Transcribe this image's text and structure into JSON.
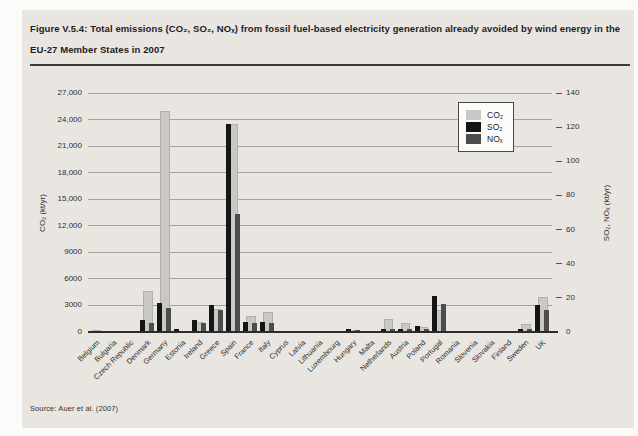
{
  "figure": {
    "title_line1": "Figure V.5.4: Total emissions (CO₂, SO₂, NOₓ) from fossil fuel-based electricity generation already avoided by wind energy in the",
    "title_line2": "EU-27 Member States in 2007",
    "source": "Source: Auer et al. (2007)"
  },
  "colors": {
    "panel_bg": "#e9e6e2",
    "co2": "#c9c8c4",
    "so2": "#151515",
    "nox": "#4c4c4c",
    "grid": "#a3a29f",
    "baseline": "#2c2c2c",
    "text": "#2e2e2e"
  },
  "chart_data": {
    "type": "bar",
    "title": "",
    "categories": [
      "Belgium",
      "Bulgaria",
      "Czech Republic",
      "Denmark",
      "Germany",
      "Estonia",
      "Ireland",
      "Greece",
      "Spain",
      "France",
      "Italy",
      "Cyprus",
      "Latvia",
      "Lithuania",
      "Luxembourg",
      "Hungary",
      "Malta",
      "Netherlands",
      "Austria",
      "Poland",
      "Portugal",
      "Romania",
      "Slovenia",
      "Slovakia",
      "Finland",
      "Sweden",
      "UK"
    ],
    "series": [
      {
        "name": "CO₂",
        "axis": "left",
        "values": [
          250,
          120,
          150,
          4600,
          25000,
          150,
          1150,
          2600,
          23500,
          1800,
          2300,
          0,
          30,
          60,
          40,
          200,
          0,
          1500,
          1050,
          550,
          2500,
          0,
          0,
          30,
          150,
          900,
          3900
        ]
      },
      {
        "name": "SO₂",
        "axis": "right",
        "values": [
          0.8,
          0.6,
          0.8,
          7,
          17,
          1.5,
          7,
          16,
          122,
          6,
          6,
          0,
          0.2,
          0.3,
          0.2,
          1.5,
          0,
          2,
          1.5,
          3.5,
          21,
          0,
          0,
          0.2,
          0.5,
          2,
          16
        ]
      },
      {
        "name": "NOₓ",
        "axis": "right",
        "values": [
          0.8,
          0.3,
          0.5,
          5,
          14,
          0.5,
          5,
          13,
          69,
          5,
          5,
          0,
          0.2,
          0.3,
          0.2,
          1,
          0,
          2,
          1.5,
          2,
          16.5,
          0,
          0,
          0.2,
          0.5,
          2,
          13
        ]
      }
    ],
    "left_axis": {
      "label": "CO₂ (kt/yr)",
      "min": 0,
      "max": 27000,
      "tick_labels": [
        "0",
        "3000",
        "6000",
        "9000",
        "12,000",
        "15,000",
        "18,000",
        "21,000",
        "24,000",
        "27,000"
      ]
    },
    "right_axis": {
      "label": "SO₂, NOₓ (kt/yr)",
      "min": 0,
      "max": 140,
      "tick_labels": [
        "0",
        "20",
        "40",
        "60",
        "80",
        "100",
        "120",
        "140"
      ]
    },
    "legend": [
      "CO₂",
      "SO₂",
      "NOₓ"
    ],
    "legend_position": "top-right",
    "grid": true
  }
}
